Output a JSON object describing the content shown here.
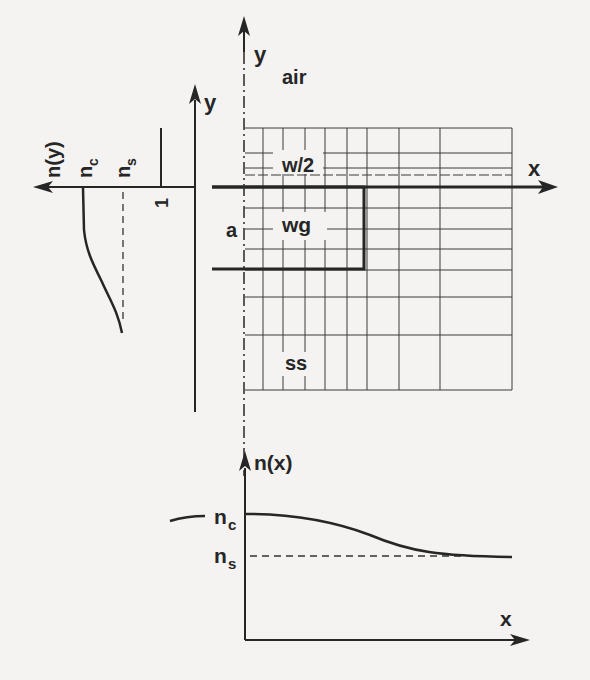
{
  "figure": {
    "type": "rectangular waveguide cross-section with refractive index profiles",
    "colors": {
      "background": "#f4f3f1",
      "ink": "#262626"
    }
  },
  "cross_section": {
    "axes": {
      "x_label": "x",
      "y_label": "y"
    },
    "regions": {
      "top": "air",
      "core": "wg",
      "bottom": "ss"
    },
    "dimensions": {
      "half_width": "w/2",
      "depth": "a"
    }
  },
  "left_profile": {
    "axis_label": "n(y)",
    "y_axis_label": "y",
    "levels": {
      "core": "n_c",
      "substrate": "n_s",
      "air": "1"
    },
    "level_labels": {
      "core_main": "n",
      "core_sub": "c",
      "sub_main": "n",
      "sub_sub": "s",
      "air": "1"
    }
  },
  "bottom_profile": {
    "axis_label": "n(x)",
    "x_axis_label": "x",
    "level_labels": {
      "core_main": "n",
      "core_sub": "c",
      "sub_main": "n",
      "sub_sub": "s"
    }
  }
}
